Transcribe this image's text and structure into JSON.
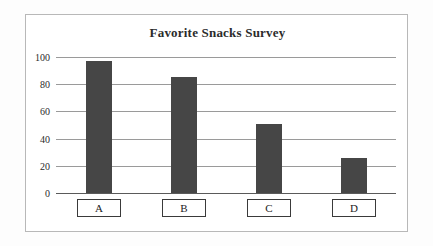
{
  "chart_data": {
    "type": "bar",
    "title": "Favorite Snacks Survey",
    "xlabel": "",
    "ylabel": "",
    "categories": [
      "A",
      "B",
      "C",
      "D"
    ],
    "values": [
      97,
      85,
      51,
      26
    ],
    "ylim": [
      0,
      100
    ],
    "yticks": [
      0,
      20,
      40,
      60,
      80,
      100
    ],
    "ytick_labels": [
      "0",
      "20",
      "40",
      "60",
      "80",
      "100"
    ],
    "grid": true,
    "legend": false,
    "bar_color": "#464646",
    "gridline_color": "#9a9a9a",
    "axis_color": "#5a5a5a",
    "frame_color": "#b8b8b8",
    "title_color": "#2b2b2b"
  }
}
